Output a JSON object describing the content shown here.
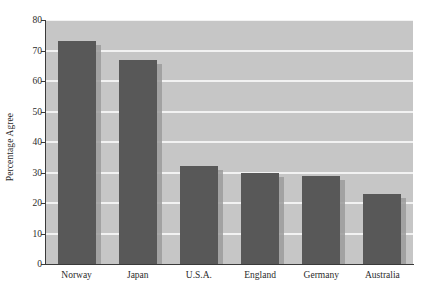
{
  "chart_data": {
    "type": "bar",
    "title": "",
    "subtitle": "",
    "xlabel": "",
    "ylabel": "Percentage Agree",
    "categories": [
      "Norway",
      "Japan",
      "U.S.A.",
      "England",
      "Germany",
      "Australia"
    ],
    "values": [
      73,
      67,
      32,
      30,
      29,
      23
    ],
    "series": [
      {
        "name": "Percentage Agree",
        "values": [
          73,
          67,
          32,
          30,
          29,
          23
        ]
      }
    ],
    "ylim": [
      0,
      80
    ],
    "yticks": [
      0,
      10,
      20,
      30,
      40,
      50,
      60,
      70,
      80
    ],
    "ytick_labels": [
      "0",
      "10",
      "20",
      "30",
      "40",
      "50",
      "60",
      "70",
      "80"
    ],
    "grid": true,
    "grid_axis": "y",
    "grid_color": "#f2f2f2",
    "legend": false,
    "legend_position": "none",
    "plot_background": "#c6c6c6",
    "bar_color": "#585858",
    "bar_shadow_color": "#9b9b9b",
    "axis_color": "#3a3a3a",
    "text_color": "#2b2b2b",
    "annotations": []
  }
}
